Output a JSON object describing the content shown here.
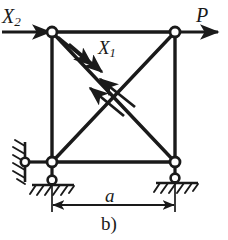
{
  "figure": {
    "caption": "b)",
    "type": "statically-indeterminate-truss-square-frame"
  },
  "labels": {
    "force_x2": "X",
    "force_x2_sub": "2",
    "force_p": "P",
    "force_x1": "X",
    "force_x1_sub": "1",
    "dimension_a": "a"
  },
  "colors": {
    "ink": "#1a1a1a",
    "background": "#ffffff",
    "node_fill": "#ffffff"
  },
  "geometry": {
    "node_top_left": [
      52,
      32
    ],
    "node_top_right": [
      175,
      32
    ],
    "node_bottom_left": [
      52,
      162
    ],
    "node_bottom_right": [
      175,
      162
    ],
    "pin_wall_left": [
      25,
      162
    ],
    "pin_ground_left": [
      52,
      180
    ],
    "pin_ground_right": [
      175,
      178
    ],
    "span_width": 123,
    "frame_height": 130
  },
  "members": [
    {
      "name": "top-chord",
      "from": "node_top_left",
      "to": "node_top_right"
    },
    {
      "name": "bottom-chord",
      "from": "node_bottom_left",
      "to": "node_bottom_right"
    },
    {
      "name": "left-post",
      "from": "node_top_left",
      "to": "node_bottom_left"
    },
    {
      "name": "right-post",
      "from": "node_top_right",
      "to": "node_bottom_right"
    },
    {
      "name": "diagonal-descending",
      "from": "node_top_left",
      "to": "node_bottom_right"
    },
    {
      "name": "diagonal-ascending",
      "from": "node_bottom_left",
      "to": "node_top_right"
    }
  ],
  "loads": [
    {
      "name": "P",
      "at": "node_top_right",
      "direction": "right",
      "magnitude_label": "P"
    },
    {
      "name": "X2",
      "at": "node_top_left",
      "direction": "right",
      "magnitude_label": "X2"
    },
    {
      "name": "X1",
      "on": "diagonal-descending",
      "type": "redundant-force-pair",
      "magnitude_label": "X1"
    }
  ],
  "supports": [
    {
      "name": "left-horizontal-link",
      "at": "node_bottom_left",
      "kind": "pinned-link-to-wall",
      "hatching": "diagonal"
    },
    {
      "name": "left-vertical-link",
      "at": "node_bottom_left",
      "kind": "pinned-link-to-ground",
      "hatching": "diagonal"
    },
    {
      "name": "right-vertical-link",
      "at": "node_bottom_right",
      "kind": "pinned-link-to-ground",
      "hatching": "diagonal"
    }
  ],
  "dimensions": [
    {
      "name": "span",
      "label": "a",
      "from_x": 52,
      "to_x": 175,
      "y": 200,
      "style": "double-arrow"
    }
  ]
}
